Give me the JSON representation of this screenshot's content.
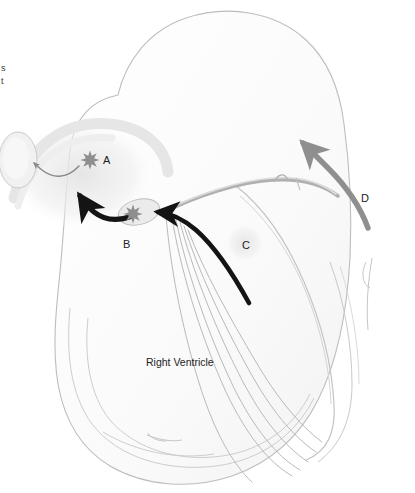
{
  "figure": {
    "background_color": "#ffffff"
  },
  "chamber_labels": [
    {
      "id": "right-ventricle",
      "text": "Right Ventricle",
      "x": 146,
      "y": 357
    }
  ],
  "point_labels": [
    {
      "id": "A",
      "text": "A",
      "x": 103,
      "y": 155
    },
    {
      "id": "B",
      "text": "B",
      "x": 123,
      "y": 239
    },
    {
      "id": "C",
      "text": "C",
      "x": 242,
      "y": 240
    },
    {
      "id": "D",
      "text": "D",
      "x": 361,
      "y": 193
    }
  ],
  "edge_text": {
    "id": "cropped-left-caption",
    "lines": [
      "s",
      "t"
    ],
    "x": 1,
    "y": 62
  },
  "markers": [
    {
      "id": "burst-a",
      "type": "starburst",
      "x": 90,
      "y": 160,
      "r": 8,
      "color": "#8e8e8e"
    },
    {
      "id": "burst-b",
      "type": "starburst",
      "x": 133,
      "y": 214,
      "r": 8,
      "color": "#8e8e8e"
    }
  ],
  "regions": [
    {
      "id": "left-ellipse",
      "type": "ellipse",
      "cx": 18,
      "cy": 160,
      "rx": 19,
      "ry": 28,
      "fill": "#f0f0f0",
      "stroke": "#c9c9c9"
    },
    {
      "id": "b-ellipse",
      "type": "ellipse",
      "cx": 139,
      "cy": 212,
      "rx": 20,
      "ry": 12,
      "fill": "#ebebeb",
      "stroke": "#bdbdbd"
    }
  ],
  "colors": {
    "outline": "#bdbdbd",
    "outline_soft": "#d2d2d2",
    "fiber": "#b7b7b7",
    "black_arrow": "#141414",
    "gray_arrow": "#8f8f8f",
    "thin_gray_arrow": "#8a8a8a",
    "halo": "#ededed",
    "label_text": "#1c1c1c"
  },
  "arrows": [
    {
      "id": "arrow-a-to-ellipse",
      "style": "thin-gray-curve",
      "from": "burst-a",
      "to": "left-ellipse",
      "color": "#8a8a8a"
    },
    {
      "id": "arrow-b-upleft",
      "style": "thick-black-curve",
      "from": "b-ellipse",
      "to": "upper-left",
      "color": "#141414"
    },
    {
      "id": "arrow-septum-to-b",
      "style": "thick-black-long",
      "from": "lower-septum",
      "to": "b-ellipse",
      "color": "#141414"
    },
    {
      "id": "arrow-d-upward",
      "style": "thick-gray-curve",
      "from": "lower-right-wall",
      "to": "outflow-tract",
      "color": "#8f8f8f"
    }
  ]
}
